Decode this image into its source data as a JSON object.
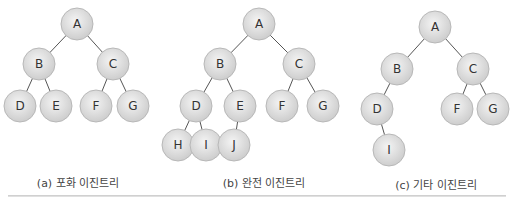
{
  "node_style": {
    "fill_center": "#f2f2f2",
    "fill_edge": "#cfcfcf",
    "stroke": "#b8b8b8",
    "edge_color": "#555555",
    "radius": 16
  },
  "trees": [
    {
      "id": "a",
      "caption": "(a) 포화 이진트리",
      "caption_pos": [
        78,
        174
      ],
      "nodes": [
        {
          "label": "A",
          "x": 77,
          "y": 24
        },
        {
          "label": "B",
          "x": 39,
          "y": 64
        },
        {
          "label": "C",
          "x": 113,
          "y": 64
        },
        {
          "label": "D",
          "x": 20,
          "y": 106
        },
        {
          "label": "E",
          "x": 56,
          "y": 106
        },
        {
          "label": "F",
          "x": 96,
          "y": 106
        },
        {
          "label": "G",
          "x": 133,
          "y": 106
        }
      ],
      "edges": [
        [
          "A",
          "B"
        ],
        [
          "A",
          "C"
        ],
        [
          "B",
          "D"
        ],
        [
          "B",
          "E"
        ],
        [
          "C",
          "F"
        ],
        [
          "C",
          "G"
        ]
      ]
    },
    {
      "id": "b",
      "caption": "(b) 완전 이진트리",
      "caption_pos": [
        264,
        174
      ],
      "nodes": [
        {
          "label": "A",
          "x": 259,
          "y": 24
        },
        {
          "label": "B",
          "x": 220,
          "y": 64
        },
        {
          "label": "C",
          "x": 299,
          "y": 64
        },
        {
          "label": "D",
          "x": 196,
          "y": 106
        },
        {
          "label": "E",
          "x": 240,
          "y": 106
        },
        {
          "label": "F",
          "x": 282,
          "y": 106
        },
        {
          "label": "G",
          "x": 323,
          "y": 106
        },
        {
          "label": "H",
          "x": 178,
          "y": 145
        },
        {
          "label": "I",
          "x": 206,
          "y": 145
        },
        {
          "label": "J",
          "x": 234,
          "y": 145
        }
      ],
      "edges": [
        [
          "A",
          "B"
        ],
        [
          "A",
          "C"
        ],
        [
          "B",
          "D"
        ],
        [
          "B",
          "E"
        ],
        [
          "C",
          "F"
        ],
        [
          "C",
          "G"
        ],
        [
          "D",
          "H"
        ],
        [
          "D",
          "I"
        ],
        [
          "E",
          "J"
        ]
      ]
    },
    {
      "id": "c",
      "caption": "(c) 기타 이진트리",
      "caption_pos": [
        436,
        176
      ],
      "nodes": [
        {
          "label": "A",
          "x": 435,
          "y": 27
        },
        {
          "label": "B",
          "x": 397,
          "y": 69
        },
        {
          "label": "C",
          "x": 473,
          "y": 69
        },
        {
          "label": "D",
          "x": 377,
          "y": 109
        },
        {
          "label": "F",
          "x": 457,
          "y": 109
        },
        {
          "label": "G",
          "x": 493,
          "y": 109
        },
        {
          "label": "I",
          "x": 389,
          "y": 150
        }
      ],
      "edges": [
        [
          "A",
          "B"
        ],
        [
          "A",
          "C"
        ],
        [
          "B",
          "D"
        ],
        [
          "C",
          "F"
        ],
        [
          "C",
          "G"
        ],
        [
          "D",
          "I"
        ]
      ]
    }
  ]
}
